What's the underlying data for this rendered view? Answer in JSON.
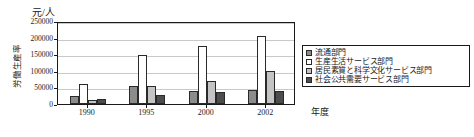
{
  "chart_data": {
    "type": "bar",
    "title": "",
    "subtitle": "",
    "unit_label": "元/人",
    "ylabel": "労働生産率",
    "xlabel": "年度",
    "categories": [
      "1990",
      "1995",
      "2000",
      "2002"
    ],
    "ylim": [
      0,
      250000
    ],
    "ytick_values": [
      0,
      50000,
      100000,
      150000,
      200000,
      250000
    ],
    "ytick_labels": [
      "0",
      "50000",
      "100000",
      "150000",
      "200000",
      "250000"
    ],
    "grid": true,
    "legend_position": "right",
    "series": [
      {
        "name": "流通部門",
        "color": "#8c8c8c",
        "values": [
          25000,
          53000,
          40000,
          43000
        ]
      },
      {
        "name": "生産生活サービス部門",
        "color": "#ffffff",
        "values": [
          60000,
          148000,
          175000,
          205000
        ]
      },
      {
        "name": "居民素質と科学文化サービス部門",
        "color": "#c4c4c4",
        "values": [
          12000,
          55000,
          70000,
          100000
        ]
      },
      {
        "name": "社会公共需要サービス部門",
        "color": "#4d4d4d",
        "values": [
          15000,
          26000,
          37000,
          40000
        ]
      }
    ]
  },
  "axis": {
    "unit_label": "元/人",
    "y_title": "労働生産率",
    "x_title": "年度"
  },
  "legend": {
    "items": [
      {
        "label": "流通部門"
      },
      {
        "label": "生産生活サービス部門"
      },
      {
        "label": "居民素質と科学文化サービス部門"
      },
      {
        "label": "社会公共需要サービス部門"
      }
    ]
  }
}
